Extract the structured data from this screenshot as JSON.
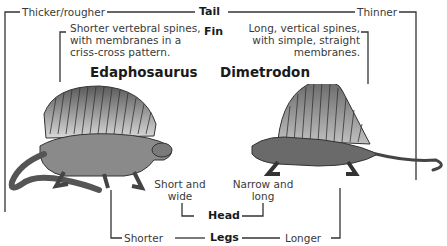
{
  "diagram": {
    "animals": [
      {
        "name": "Edaphosaurus"
      },
      {
        "name": "Dimetrodon"
      }
    ],
    "features": {
      "tail": {
        "label": "Tail",
        "edaphosaurus": "Thicker/rougher",
        "dimetrodon": "Thinner"
      },
      "fin": {
        "label": "Fin",
        "edaphosaurus": [
          "Shorter vertebral spines,",
          "with membranes in a",
          "criss-cross pattern."
        ],
        "dimetrodon": [
          "Long, vertical spines,",
          "with simple, straight",
          "membranes."
        ]
      },
      "head": {
        "label": "Head",
        "edaphosaurus": [
          "Short and",
          "wide"
        ],
        "dimetrodon": [
          "Narrow and",
          "long"
        ]
      },
      "legs": {
        "label": "Legs",
        "edaphosaurus": "Shorter",
        "dimetrodon": "Longer"
      }
    },
    "colors": {
      "line": "#333333",
      "text": "#3a3a3a",
      "illustration_dark": "#4a4a4a",
      "illustration_mid": "#8a8a8a",
      "illustration_light": "#c8c8c8"
    }
  }
}
